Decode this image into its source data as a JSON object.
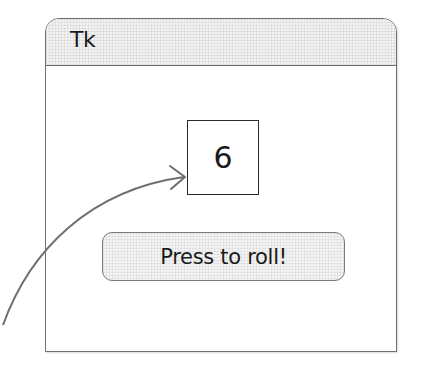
{
  "window": {
    "title": "Tk"
  },
  "die": {
    "value": "6"
  },
  "button": {
    "label": "Press to roll!"
  },
  "annotation": {
    "icon": "curved-arrow-icon",
    "color": "#6e6e6e",
    "points_to": "die-display"
  }
}
